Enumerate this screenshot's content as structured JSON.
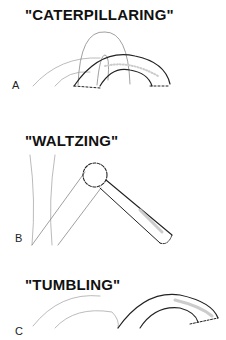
{
  "panels": [
    {
      "label": "A",
      "title": "\"CATERPILLARING\""
    },
    {
      "label": "B",
      "title": "\"WALTZING\""
    },
    {
      "label": "C",
      "title": "\"TUMBLING\""
    }
  ],
  "colors": {
    "ink": "#222222",
    "faint": "#9a9a9a",
    "shade": "#c8c8c8"
  }
}
